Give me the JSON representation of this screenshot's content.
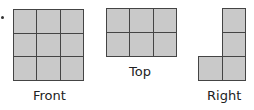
{
  "views": [
    {
      "id": "front",
      "label": "Front",
      "cols": 3,
      "rows": 3,
      "cells": [
        1,
        1,
        1,
        1,
        1,
        1,
        1,
        1,
        1
      ]
    },
    {
      "id": "top",
      "label": "Top",
      "cols": 3,
      "rows": 2,
      "cells": [
        1,
        1,
        1,
        1,
        1,
        1
      ]
    },
    {
      "id": "right",
      "label": "Right",
      "cols": 2,
      "rows": 3,
      "cells": [
        0,
        1,
        0,
        1,
        1,
        1
      ]
    }
  ],
  "colors": {
    "fill": "#c9c9c9",
    "line": "#444444"
  }
}
